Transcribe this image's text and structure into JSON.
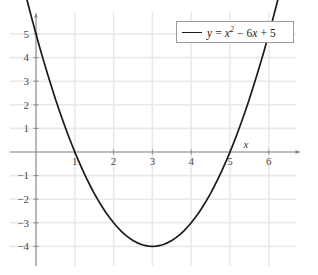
{
  "chart_data": {
    "type": "line",
    "title": "",
    "subtitle": "",
    "xlabel": "x",
    "ylabel": "",
    "legend": [
      {
        "label": "y = x^2 - 6x + 5",
        "label_parts": {
          "y": "y",
          "equals": "=",
          "x": "x",
          "exponent": "2",
          "minus": "−",
          "six": "6",
          "x2": "x",
          "plus": "+",
          "five": "5"
        },
        "color": "#1a1a1a"
      }
    ],
    "legend_position": "top-right",
    "grid": true,
    "xlim": [
      -0.35,
      6.45
    ],
    "ylim": [
      -4.75,
      5.9
    ],
    "xticks": [
      1,
      2,
      3,
      4,
      5,
      6
    ],
    "xticklabels": [
      "1",
      "2",
      "3",
      "4",
      "5",
      "6"
    ],
    "yticks": [
      5,
      4,
      3,
      2,
      1,
      -1,
      -2,
      -3,
      -4
    ],
    "yticklabels": [
      "5",
      "4",
      "3",
      "2",
      "1",
      "−1",
      "−2",
      "−3",
      "−4"
    ],
    "equation": "y = x^2 - 6x + 5",
    "vertex": [
      3,
      -4
    ],
    "roots": [
      1,
      5
    ],
    "y_intercept": 5,
    "series": [
      {
        "name": "y = x^2 - 6x + 5",
        "color": "#1a1a1a",
        "points": [
          [
            -0.3,
            6.89
          ],
          [
            -0.2,
            6.24
          ],
          [
            -0.1,
            5.61
          ],
          [
            0,
            5
          ],
          [
            0.1,
            4.41
          ],
          [
            0.2,
            3.84
          ],
          [
            0.3,
            3.29
          ],
          [
            0.4,
            2.76
          ],
          [
            0.5,
            2.25
          ],
          [
            0.6,
            1.76
          ],
          [
            0.7,
            1.29
          ],
          [
            0.8,
            0.84
          ],
          [
            0.9,
            0.41
          ],
          [
            1,
            0
          ],
          [
            1.1,
            -0.39
          ],
          [
            1.2,
            -0.76
          ],
          [
            1.3,
            -1.11
          ],
          [
            1.4,
            -1.44
          ],
          [
            1.5,
            -1.75
          ],
          [
            1.6,
            -2.04
          ],
          [
            1.7,
            -2.31
          ],
          [
            1.8,
            -2.56
          ],
          [
            1.9,
            -2.79
          ],
          [
            2,
            -3
          ],
          [
            2.1,
            -3.19
          ],
          [
            2.2,
            -3.36
          ],
          [
            2.3,
            -3.51
          ],
          [
            2.4,
            -3.64
          ],
          [
            2.5,
            -3.75
          ],
          [
            2.6,
            -3.84
          ],
          [
            2.7,
            -3.91
          ],
          [
            2.8,
            -3.96
          ],
          [
            2.9,
            -3.99
          ],
          [
            3,
            -4
          ],
          [
            3.1,
            -3.99
          ],
          [
            3.2,
            -3.96
          ],
          [
            3.3,
            -3.91
          ],
          [
            3.4,
            -3.84
          ],
          [
            3.5,
            -3.75
          ],
          [
            3.6,
            -3.64
          ],
          [
            3.7,
            -3.51
          ],
          [
            3.8,
            -3.36
          ],
          [
            3.9,
            -3.19
          ],
          [
            4,
            -3
          ],
          [
            4.1,
            -2.79
          ],
          [
            4.2,
            -2.56
          ],
          [
            4.3,
            -2.31
          ],
          [
            4.4,
            -2.04
          ],
          [
            4.5,
            -1.75
          ],
          [
            4.6,
            -1.44
          ],
          [
            4.7,
            -1.11
          ],
          [
            4.8,
            -0.76
          ],
          [
            4.9,
            -0.39
          ],
          [
            5,
            0
          ],
          [
            5.1,
            0.41
          ],
          [
            5.2,
            0.84
          ],
          [
            5.3,
            1.29
          ],
          [
            5.4,
            1.76
          ],
          [
            5.5,
            2.25
          ],
          [
            5.6,
            2.76
          ],
          [
            5.7,
            3.29
          ],
          [
            5.8,
            3.84
          ],
          [
            5.9,
            4.41
          ],
          [
            6,
            5
          ],
          [
            6.1,
            5.61
          ],
          [
            6.2,
            6.24
          ],
          [
            6.3,
            6.89
          ]
        ]
      }
    ]
  },
  "colors": {
    "curve": "#1a1a1a",
    "axis": "#8a8a8a",
    "grid": "#e9e9e9",
    "tick_text": "#4a4a4a",
    "legend_border": "#9a9a9a",
    "background": "#ffffff"
  }
}
